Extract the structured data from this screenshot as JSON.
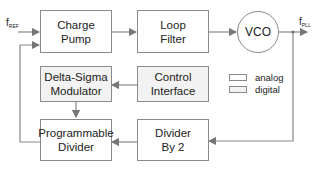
{
  "diagram": {
    "type": "PLL block diagram",
    "blocks": [
      {
        "id": "charge_pump",
        "label": "Charge\nPump",
        "kind": "analog"
      },
      {
        "id": "loop_filter",
        "label": "Loop\nFilter",
        "kind": "analog"
      },
      {
        "id": "vco",
        "label": "VCO",
        "kind": "analog"
      },
      {
        "id": "delta_sigma",
        "label": "Delta-Sigma\nModulator",
        "kind": "digital"
      },
      {
        "id": "control_interface",
        "label": "Control\nInterface",
        "kind": "digital"
      },
      {
        "id": "programmable_divider",
        "label": "Programmable\nDivider",
        "kind": "analog"
      },
      {
        "id": "divider_by_2",
        "label": "Divider\nBy 2",
        "kind": "analog"
      }
    ],
    "signals": {
      "input": {
        "base": "f",
        "sub": "REF"
      },
      "output": {
        "base": "f",
        "sub": "PLL"
      }
    },
    "legend": [
      {
        "label": "analog",
        "color": "#ffffff"
      },
      {
        "label": "digital",
        "color": "#f2f2f2"
      }
    ],
    "connections": [
      [
        "fREF",
        "charge_pump"
      ],
      [
        "charge_pump",
        "loop_filter"
      ],
      [
        "loop_filter",
        "vco"
      ],
      [
        "vco",
        "fPLL"
      ],
      [
        "fPLL",
        "divider_by_2"
      ],
      [
        "divider_by_2",
        "programmable_divider"
      ],
      [
        "control_interface",
        "delta_sigma"
      ],
      [
        "delta_sigma",
        "programmable_divider"
      ],
      [
        "programmable_divider",
        "charge_pump"
      ]
    ]
  }
}
